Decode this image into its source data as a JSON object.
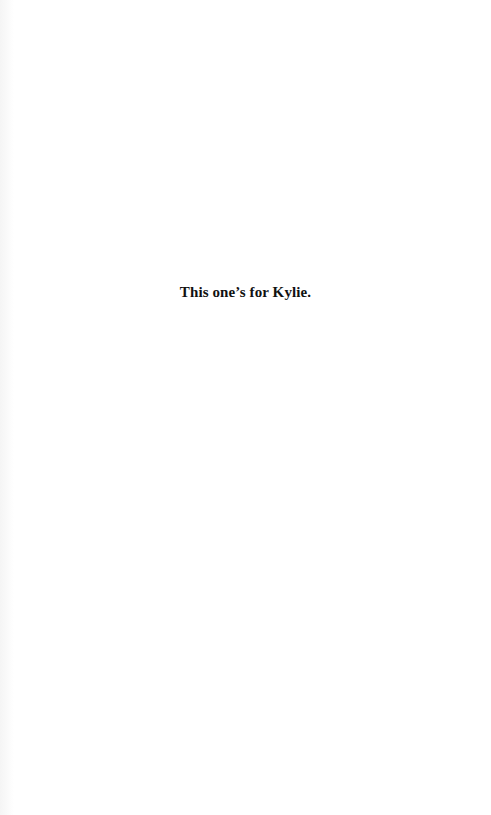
{
  "page": {
    "dedication": "This one’s for Kylie."
  }
}
